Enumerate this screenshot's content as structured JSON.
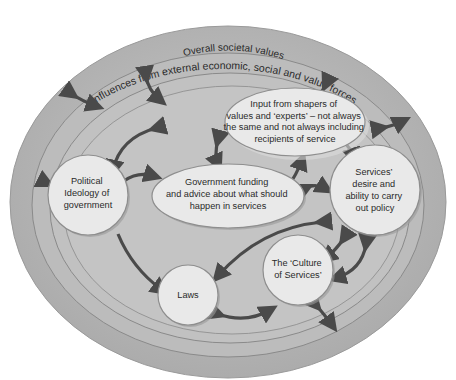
{
  "diagram": {
    "colors": {
      "background": "#ffffff",
      "outer_ring": "#b3b3b3",
      "middle_ring": "#bdbdbd",
      "inner_ring": "#c2c2c2",
      "core": "#c6c6c6",
      "ring_line": "#8a8a8a",
      "node_fill": "#e9e9e9",
      "node_stroke": "#8e8e8e",
      "arrow": "#4a4a4a",
      "text": "#2a2a2a"
    },
    "rings": [
      {
        "id": "external",
        "label": "Influences from external economic, social and value forces"
      },
      {
        "id": "societal",
        "label": "Overall societal values"
      }
    ],
    "nodes": {
      "shapers": {
        "lines": [
          "Input from shapers of",
          "values and ‘experts’ – not always",
          "the same and not always including",
          "recipients of service"
        ]
      },
      "ideology": {
        "lines": [
          "Political",
          "Ideology of",
          "government"
        ]
      },
      "funding": {
        "lines": [
          "Government funding",
          "and advice about what should",
          "happen in services"
        ]
      },
      "services": {
        "lines": [
          "Services’",
          "desire and",
          "ability to carry",
          "out policy"
        ]
      },
      "laws": {
        "lines": [
          "Laws"
        ]
      },
      "culture": {
        "lines": [
          "The ‘Culture",
          "of Services’"
        ]
      }
    },
    "arrows": [
      {
        "from": "external",
        "to": "societal",
        "type": "bidirectional",
        "position": "top-left"
      },
      {
        "from": "societal",
        "to": "shapers",
        "type": "bidirectional",
        "position": "top-left-inner"
      },
      {
        "from": "societal",
        "to": "shapers",
        "type": "bidirectional",
        "position": "top-right-inner"
      },
      {
        "from": "external",
        "to": "societal",
        "type": "bidirectional",
        "position": "right-upper"
      },
      {
        "from": "societal",
        "to": "services",
        "type": "bidirectional",
        "position": "right"
      },
      {
        "from": "external",
        "to": "ideology",
        "type": "bidirectional",
        "position": "left"
      },
      {
        "from": "shapers",
        "to": "ideology",
        "type": "bidirectional"
      },
      {
        "from": "shapers",
        "to": "funding",
        "type": "unidirectional"
      },
      {
        "from": "funding",
        "to": "shapers",
        "type": "bidirectional"
      },
      {
        "from": "shapers",
        "to": "services",
        "type": "bidirectional"
      },
      {
        "from": "ideology",
        "to": "funding",
        "type": "unidirectional"
      },
      {
        "from": "funding",
        "to": "services",
        "type": "bidirectional"
      },
      {
        "from": "ideology",
        "to": "laws",
        "type": "unidirectional"
      },
      {
        "from": "services",
        "to": "laws",
        "type": "bidirectional"
      },
      {
        "from": "services",
        "to": "culture",
        "type": "bidirectional"
      },
      {
        "from": "services",
        "to": "culture",
        "type": "unidirectional",
        "position": "right-curve"
      },
      {
        "from": "laws",
        "to": "culture",
        "type": "bidirectional"
      },
      {
        "from": "culture",
        "to": "external",
        "type": "bidirectional",
        "position": "bottom-right"
      }
    ]
  }
}
